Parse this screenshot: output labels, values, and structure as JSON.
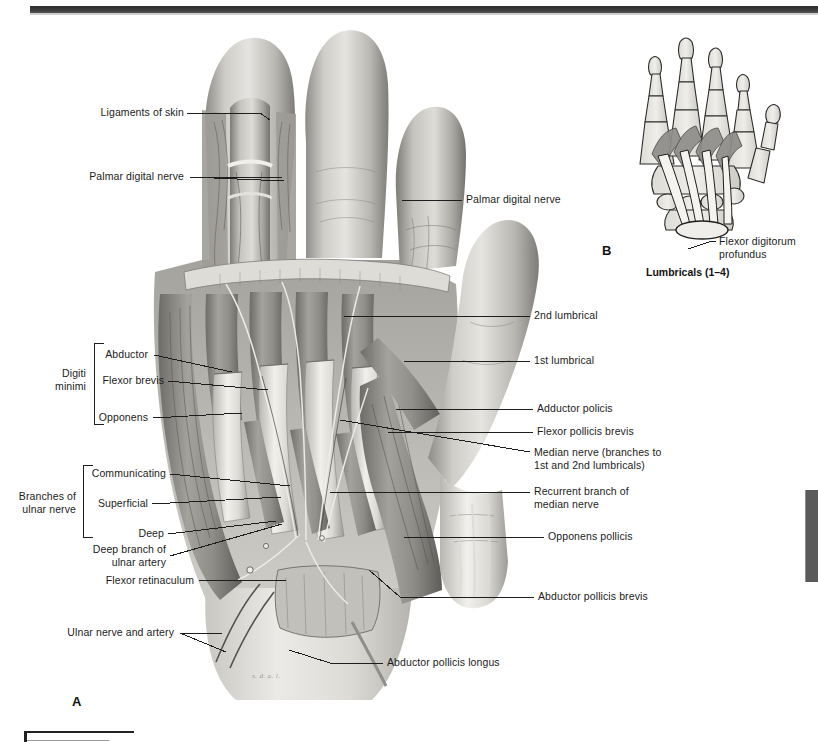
{
  "figure": {
    "panel_a_letter": "A",
    "panel_b_letter": "B",
    "panel_b_caption": "Lumbricals (1–4)"
  },
  "labels_left": [
    {
      "id": "ligaments-of-skin",
      "text": "Ligaments of skin"
    },
    {
      "id": "palmar-digital-nerve-left",
      "text": "Palmar digital nerve"
    },
    {
      "id": "abductor",
      "text": "Abductor"
    },
    {
      "id": "flexor-brevis",
      "text": "Flexor brevis"
    },
    {
      "id": "opponens",
      "text": "Opponens"
    },
    {
      "id": "communicating",
      "text": "Communicating"
    },
    {
      "id": "superficial",
      "text": "Superficial"
    },
    {
      "id": "deep",
      "text": "Deep"
    },
    {
      "id": "deep-branch-ulnar-artery",
      "text": "Deep branch of\nulnar artery"
    },
    {
      "id": "flexor-retinaculum",
      "text": "Flexor retinaculum"
    },
    {
      "id": "ulnar-nerve-and-artery",
      "text": "Ulnar nerve and artery"
    }
  ],
  "brackets_left": [
    {
      "id": "digiti-minimi",
      "text": "Digiti\nminimi"
    },
    {
      "id": "branches-ulnar-nerve",
      "text": "Branches of\nulnar nerve"
    }
  ],
  "labels_right": [
    {
      "id": "palmar-digital-nerve-right",
      "text": "Palmar digital nerve"
    },
    {
      "id": "second-lumbrical",
      "text": "2nd lumbrical"
    },
    {
      "id": "first-lumbrical",
      "text": "1st lumbrical"
    },
    {
      "id": "adductor-policis",
      "text": "Adductor policis"
    },
    {
      "id": "flexor-pollicis-brevis",
      "text": "Flexor pollicis brevis"
    },
    {
      "id": "median-nerve",
      "text": "Median nerve (branches to\n1st and 2nd lumbricals)"
    },
    {
      "id": "recurrent-branch-median",
      "text": "Recurrent branch of\nmedian nerve"
    },
    {
      "id": "opponens-pollicis",
      "text": "Opponens pollicis"
    },
    {
      "id": "abductor-pollicis-brevis",
      "text": "Abductor pollicis brevis"
    },
    {
      "id": "abductor-pollicis-longus",
      "text": "Abductor pollicis longus"
    }
  ],
  "labels_panel_b": [
    {
      "id": "flexor-digitorum-profundus",
      "text": "Flexor digitorum\nprofundus"
    }
  ],
  "colors": {
    "header_rule": "#32322f",
    "edge_tab": "#5b5b5b",
    "leader_line": "#1d1d1d",
    "text": "#1c1c1c",
    "bone_fill": "#e3e1dc",
    "bone_stroke": "#2b2b2b",
    "muscle_fill": "#a9a7a3",
    "tendon_fill": "#f2f1ee"
  }
}
